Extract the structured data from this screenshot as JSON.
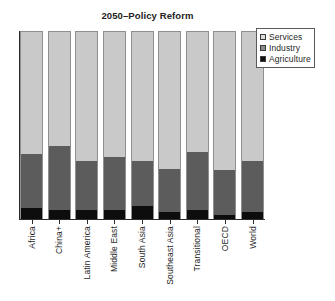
{
  "chart_data": {
    "type": "bar",
    "title": "2050–Policy Reform",
    "xlabel": "",
    "ylabel": "",
    "ylim": [
      0,
      100
    ],
    "stacked": true,
    "grid": false,
    "legend_position": "top-right",
    "categories": [
      "Africa",
      "China+",
      "Latin America",
      "Middle East",
      "South Asia",
      "Southeast Asia",
      "Transitional",
      "OECD",
      "World"
    ],
    "series": [
      {
        "name": "Services",
        "color": "#c9c9c9",
        "values": [
          65,
          61,
          69,
          67,
          69,
          73,
          64,
          74,
          69
        ]
      },
      {
        "name": "Industry",
        "color": "#5c5c5c",
        "values": [
          29,
          34,
          26,
          28,
          24,
          23,
          31,
          24,
          27
        ]
      },
      {
        "name": "Agriculture",
        "color": "#0d0d0d",
        "values": [
          6,
          5,
          5,
          5,
          7,
          4,
          5,
          2,
          4
        ]
      }
    ]
  },
  "legend": {
    "items": [
      {
        "label": "Services",
        "swatch": "services-swatch"
      },
      {
        "label": "Industry",
        "swatch": "industry-swatch"
      },
      {
        "label": "Agriculture",
        "swatch": "agriculture-swatch"
      }
    ]
  },
  "colors": {
    "services": "#c9c9c9",
    "industry": "#5c5c5c",
    "agriculture": "#0d0d0d",
    "axis": "#2b2b2b",
    "background": "#ffffff"
  }
}
